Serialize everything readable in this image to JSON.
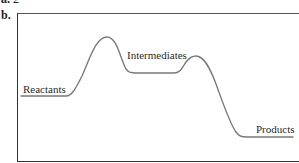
{
  "part_a": {
    "marker": "a.",
    "value": "2"
  },
  "part_b": {
    "marker": "b."
  },
  "diagram": {
    "type": "reaction-energy-profile",
    "line_color": "#777777",
    "frame_color": "#333333",
    "stages": [
      {
        "label": "Reactants"
      },
      {
        "label": "Intermediates"
      },
      {
        "label": "Products"
      }
    ],
    "peaks": 2
  }
}
